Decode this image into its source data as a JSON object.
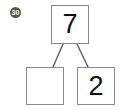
{
  "problem": {
    "number_label": "30"
  },
  "number_bond": {
    "whole": "7",
    "part_left": "",
    "part_right": "2"
  },
  "colors": {
    "line": "#666666",
    "border": "#888888"
  }
}
